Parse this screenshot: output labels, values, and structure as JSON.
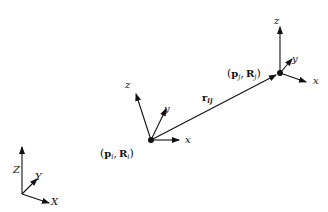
{
  "diagram": {
    "colors": {
      "stroke": "#111111",
      "background": "#ffffff"
    },
    "frame_i": {
      "label_p": "p",
      "label_p_sub": "i",
      "label_R": "R",
      "label_R_sub": "i",
      "open_paren": "(",
      "comma": ",",
      "close_paren": ")",
      "axes": {
        "x": "x",
        "y": "y",
        "z": "z"
      }
    },
    "frame_j": {
      "label_p": "p",
      "label_p_sub": "j",
      "label_R": "R",
      "label_R_sub": "j",
      "open_paren": "(",
      "comma": ",",
      "close_paren": ")",
      "axes": {
        "x": "x",
        "y": "y",
        "z": "z"
      }
    },
    "relative_vector": {
      "label": "r",
      "sub": "ij"
    },
    "world_frame": {
      "axes": {
        "X": "X",
        "Y": "Y",
        "Z": "Z"
      }
    }
  }
}
